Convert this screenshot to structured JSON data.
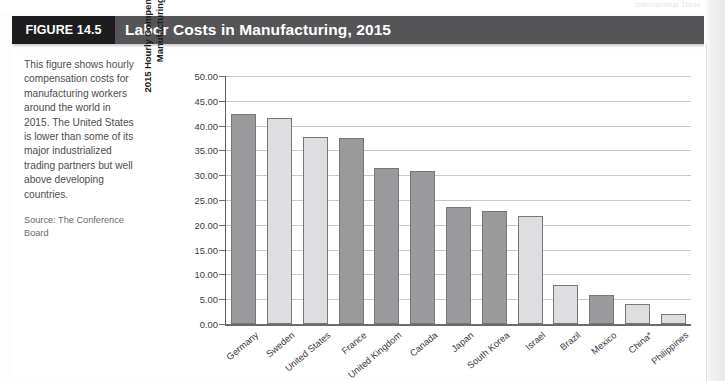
{
  "running_head": {
    "text": "International Trade",
    "page_number": "395"
  },
  "figure": {
    "badge": "FIGURE 14.5",
    "title": "Labor Costs in Manufacturing, 2015"
  },
  "caption": {
    "body": "This figure shows hourly compensation costs for manufacturing workers around the world in 2015. The United States is lower than some of its major industrialized trading partners but well above developing countries.",
    "source": "Source: The Conference Board"
  },
  "colors": {
    "badge_background": "#1d1d1f",
    "title_background": "#555558",
    "title_text": "#ffffff",
    "bar_dark": "#9a9a9c",
    "bar_light": "#dedee0",
    "bar_outline": "#77777a",
    "gridline": "#c9c9cb",
    "axis": "#6b6b6e",
    "caption_text": "#4c4c4f"
  },
  "chart_data": {
    "type": "bar",
    "title": "Labor Costs in Manufacturing, 2015",
    "xlabel": "",
    "ylabel": "2015 Hourly Compensation Costs for Manufacturing (dollars)",
    "ylim": [
      0,
      50
    ],
    "ytick_labels": [
      "50.00",
      "45.00",
      "40.00",
      "35.00",
      "30.00",
      "25.00",
      "20.00",
      "15.00",
      "10.00",
      "5.00",
      "0.00"
    ],
    "ytick_values": [
      50,
      45,
      40,
      35,
      30,
      25,
      20,
      15,
      10,
      5,
      0
    ],
    "grid": true,
    "legend": "none",
    "categories": [
      "Germany",
      "Sweden",
      "United States",
      "France",
      "United Kingdom",
      "Canada",
      "Japan",
      "South Korea",
      "Israel",
      "Brazil",
      "Mexico",
      "China*",
      "Philippines"
    ],
    "values": [
      42.4,
      41.6,
      37.7,
      37.6,
      31.4,
      30.8,
      23.6,
      22.7,
      21.7,
      7.9,
      5.9,
      4.0,
      2.0
    ],
    "bar_shades": [
      "dark",
      "light",
      "light",
      "dark",
      "dark",
      "dark",
      "dark",
      "dark",
      "light",
      "light",
      "dark",
      "light",
      "light"
    ]
  }
}
